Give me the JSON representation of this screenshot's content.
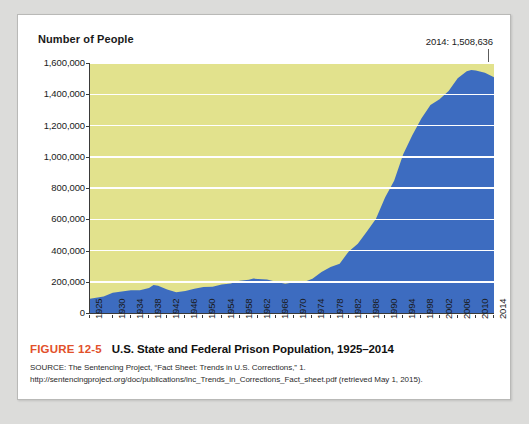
{
  "chart_data": {
    "type": "area",
    "title": "U.S. State and Federal Prison Population, 1925–2014",
    "xlabel": "",
    "ylabel": "Number of People",
    "xlim": [
      1925,
      2014
    ],
    "ylim": [
      0,
      1600000
    ],
    "grid": true,
    "legend": "none",
    "series_color": "#3d6cc0",
    "plot_background": "#e2e28d",
    "gridline_color": "#ffffff",
    "ytick_labels": [
      "1,600,000",
      "1,400,000",
      "1,200,000",
      "1,000,000",
      "800,000",
      "600,000",
      "400,000",
      "200,000",
      "0"
    ],
    "ytick_values": [
      1600000,
      1400000,
      1200000,
      1000000,
      800000,
      600000,
      400000,
      200000,
      0
    ],
    "xtick_labels": [
      "1925",
      "1930",
      "1934",
      "1938",
      "1942",
      "1946",
      "1950",
      "1954",
      "1958",
      "1962",
      "1966",
      "1970",
      "1974",
      "1978",
      "1982",
      "1986",
      "1990",
      "1994",
      "1998",
      "2002",
      "2006",
      "2010",
      "2014"
    ],
    "xtick_values": [
      1925,
      1930,
      1934,
      1938,
      1942,
      1946,
      1950,
      1954,
      1958,
      1962,
      1966,
      1970,
      1974,
      1978,
      1982,
      1986,
      1990,
      1994,
      1998,
      2002,
      2006,
      2010,
      2014
    ],
    "annotation": "2014: 1,508,636",
    "annotation_year": 2014,
    "annotation_value": 1508636,
    "x": [
      1925,
      1928,
      1930,
      1932,
      1934,
      1936,
      1938,
      1939,
      1940,
      1942,
      1944,
      1946,
      1948,
      1950,
      1952,
      1954,
      1956,
      1958,
      1960,
      1961,
      1962,
      1964,
      1966,
      1968,
      1970,
      1972,
      1974,
      1976,
      1978,
      1980,
      1982,
      1984,
      1986,
      1988,
      1990,
      1992,
      1994,
      1996,
      1998,
      2000,
      2002,
      2004,
      2006,
      2008,
      2009,
      2010,
      2012,
      2014
    ],
    "y": [
      91669,
      106000,
      129453,
      137997,
      145038,
      145038,
      160000,
      179818,
      173706,
      150384,
      132456,
      140079,
      155977,
      166123,
      168233,
      182901,
      189565,
      205643,
      212953,
      220149,
      217283,
      214336,
      199654,
      187914,
      196429,
      196092,
      218466,
      262833,
      294396,
      315974,
      394374,
      443398,
      522084,
      603732,
      739980,
      846277,
      1016691,
      1137722,
      1245402,
      1331278,
      1367856,
      1421345,
      1502179,
      1547742,
      1555600,
      1552669,
      1537000,
      1508636
    ]
  },
  "figure": {
    "number": "FIGURE 12-5",
    "title": "U.S. State and Federal Prison Population, 1925–2014",
    "source": "SOURCE: The Sentencing Project, “Fact Sheet: Trends in U.S. Corrections,” 1. http://sentencingproject.org/doc/publications/inc_Trends_in_Corrections_Fact_sheet.pdf (retrieved May 1, 2015)."
  },
  "colors": {
    "accent": "#e2502a",
    "series": "#3d6cc0",
    "plot_bg": "#e2e28d"
  }
}
